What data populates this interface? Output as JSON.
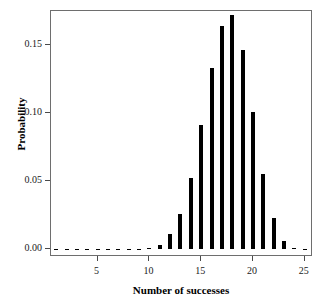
{
  "chart_data": {
    "type": "bar",
    "title": "",
    "xlabel": "Number of successes",
    "ylabel": "Probability",
    "categories": [
      1,
      2,
      3,
      4,
      5,
      6,
      7,
      8,
      9,
      10,
      11,
      12,
      13,
      14,
      15,
      16,
      17,
      18,
      19,
      20,
      21,
      22,
      23,
      24,
      25
    ],
    "values": [
      0.0,
      0.0,
      0.0,
      0.0,
      0.0,
      0.0,
      0.0,
      0.0,
      0.0,
      0.0005,
      0.003,
      0.011,
      0.026,
      0.052,
      0.091,
      0.133,
      0.164,
      0.172,
      0.146,
      0.101,
      0.055,
      0.023,
      0.006,
      0.001,
      0.0
    ],
    "xlim": [
      0.5,
      25.8
    ],
    "ylim": [
      0.0,
      0.1806
    ],
    "xticks": [
      5,
      10,
      15,
      20,
      25
    ],
    "xtick_labels": [
      "5",
      "10",
      "15",
      "20",
      "25"
    ],
    "yticks": [
      0.0,
      0.05,
      0.1,
      0.15
    ],
    "ytick_labels": [
      "0.00",
      "0.05",
      "0.10",
      "0.15"
    ],
    "grid": false,
    "legend": null,
    "bar_color": "#000000",
    "frame_color": "#6e6e6e",
    "background": "#ffffff"
  }
}
